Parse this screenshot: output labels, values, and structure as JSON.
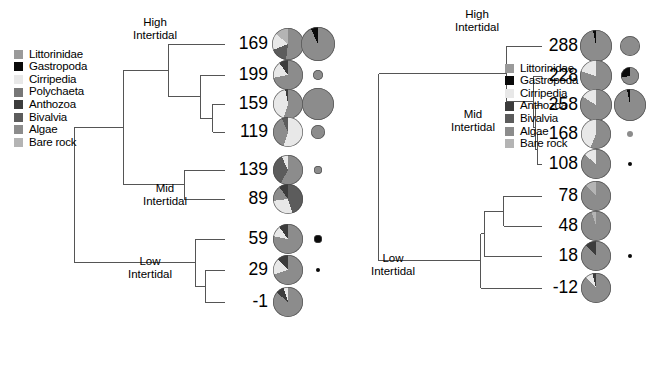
{
  "figure": {
    "width": 659,
    "height": 388,
    "background": "#ffffff"
  },
  "colors": {
    "Littorinidae": "#9a9a9a",
    "Gastropoda": "#0a0a0a",
    "Cirripedia": "#e8e8e8",
    "Polychaeta": "#777777",
    "Anthozoa": "#3c3c3c",
    "Bivalvia": "#5c5c5c",
    "Algae": "#8c8c8c",
    "Bare rock": "#b4b4b4",
    "line": "#555555",
    "text": "#000000"
  },
  "panels": [
    {
      "id": "left",
      "legend": {
        "title": "",
        "items": [
          {
            "label": "Littorinidae",
            "color": "#9a9a9a"
          },
          {
            "label": "Gastropoda",
            "color": "#0a0a0a"
          },
          {
            "label": "Cirripedia",
            "color": "#e8e8e8"
          },
          {
            "label": "Polychaeta",
            "color": "#777777"
          },
          {
            "label": "Anthozoa",
            "color": "#3c3c3c"
          },
          {
            "label": "Bivalvia",
            "color": "#5c5c5c"
          },
          {
            "label": "Algae",
            "color": "#8c8c8c"
          },
          {
            "label": "Bare rock",
            "color": "#b4b4b4"
          }
        ]
      },
      "cluster_names": [
        {
          "label": "High\nIntertidal",
          "line1": "High",
          "line2": "Intertidal"
        },
        {
          "label": "Mid\nIntertidal",
          "line1": "Mid",
          "line2": "Intertidal"
        },
        {
          "label": "Low\nIntertidal",
          "line1": "Low",
          "line2": "Intertidal"
        }
      ],
      "tips": [
        "169",
        "199",
        "159",
        "119",
        "139",
        "89",
        "59",
        "29",
        "-1"
      ],
      "axis": {
        "title": "Chord distance",
        "ticks": [
          "1.50",
          "1.25",
          "1.00",
          "0.75",
          "0.50",
          "0.25",
          "0.00"
        ],
        "min": 0.0,
        "max": 1.5,
        "reversed": true
      }
    },
    {
      "id": "right",
      "legend": {
        "title": "",
        "items": [
          {
            "label": "Littorinidae",
            "color": "#9a9a9a"
          },
          {
            "label": "Gastropoda",
            "color": "#0a0a0a"
          },
          {
            "label": "Cirripedia",
            "color": "#e8e8e8"
          },
          {
            "label": "Anthozoa",
            "color": "#3c3c3c"
          },
          {
            "label": "Bivalvia",
            "color": "#5c5c5c"
          },
          {
            "label": "Algae",
            "color": "#8c8c8c"
          },
          {
            "label": "Bare rock",
            "color": "#b4b4b4"
          }
        ]
      },
      "cluster_names": [
        {
          "label": "High\nIntertidal",
          "line1": "High",
          "line2": "Intertidal"
        },
        {
          "label": "Mid\nIntertidal",
          "line1": "Mid",
          "line2": "Intertidal"
        },
        {
          "label": "Low\nIntertidal",
          "line1": "Low",
          "line2": "Intertidal"
        }
      ],
      "tips": [
        "288",
        "228",
        "258",
        "168",
        "108",
        "78",
        "48",
        "18",
        "-12"
      ],
      "axis": {
        "title": "Chord distance",
        "ticks": [
          "1.50",
          "1.25",
          "1.00",
          "0.75",
          "0.50",
          "0.25",
          "0.00"
        ],
        "min": 0.0,
        "max": 1.5,
        "reversed": true
      }
    }
  ],
  "chart_data": {
    "type": "dendrogram-with-pies",
    "title": "",
    "xlabel": "Chord distance",
    "xlim": [
      1.5,
      0.0
    ],
    "x_ticks": [
      1.5,
      1.25,
      1.0,
      0.75,
      0.5,
      0.25,
      0.0
    ],
    "grid": false,
    "legend_position": "upper-left",
    "categories": [
      "Littorinidae",
      "Gastropoda",
      "Cirripedia",
      "Polychaeta",
      "Anthozoa",
      "Bivalvia",
      "Algae",
      "Bare rock"
    ],
    "panels": [
      {
        "name": "left",
        "leaves": [
          "169",
          "199",
          "159",
          "119",
          "139",
          "89",
          "59",
          "29",
          "-1"
        ],
        "clusters": [
          {
            "name": "High Intertidal",
            "members": [
              "169",
              "199",
              "159",
              "119"
            ]
          },
          {
            "name": "Mid Intertidal",
            "members": [
              "139",
              "89"
            ]
          },
          {
            "name": "Low Intertidal",
            "members": [
              "59",
              "29",
              "-1"
            ]
          }
        ],
        "merges": [
          {
            "left": "159",
            "right": "119",
            "height": 0.1
          },
          {
            "left": "199",
            "right": "(159,119)",
            "height": 0.2
          },
          {
            "left": "169",
            "right": "(199,159,119)",
            "height": 0.46
          },
          {
            "left": "139",
            "right": "89",
            "height": 0.33
          },
          {
            "left": "High",
            "right": "Mid",
            "height": 0.82
          },
          {
            "left": "59",
            "right": "(29,-1)",
            "height": 0.24
          },
          {
            "left": "29",
            "right": "-1",
            "height": 0.16
          },
          {
            "left": "(High,Mid)",
            "right": "Low",
            "height": 1.22
          }
        ],
        "series": [
          {
            "leaf": "169",
            "pie": [
              {
                "cat": "Algae",
                "value": 52
              },
              {
                "cat": "Bivalvia",
                "value": 17
              },
              {
                "cat": "Cirripedia",
                "value": 17
              },
              {
                "cat": "Bare rock",
                "value": 14
              }
            ],
            "pie_radius_px": 16,
            "satellite_radius_px": 17,
            "satellite_color": "#9a9a9a",
            "satellite_pie": [
              {
                "cat": "Algae",
                "value": 93
              },
              {
                "cat": "Gastropoda",
                "value": 7
              }
            ]
          },
          {
            "leaf": "199",
            "pie": [
              {
                "cat": "Algae",
                "value": 72
              },
              {
                "cat": "Cirripedia",
                "value": 18
              },
              {
                "cat": "Anthozoa",
                "value": 10
              }
            ],
            "pie_radius_px": 15,
            "satellite_radius_px": 5,
            "satellite_color": "#9a9a9a",
            "satellite_pie": [
              {
                "cat": "Algae",
                "value": 100
              }
            ]
          },
          {
            "leaf": "159",
            "pie": [
              {
                "cat": "Algae",
                "value": 55
              },
              {
                "cat": "Cirripedia",
                "value": 42
              },
              {
                "cat": "Anthozoa",
                "value": 3
              }
            ],
            "pie_radius_px": 15,
            "satellite_radius_px": 16,
            "satellite_color": "#9a9a9a",
            "satellite_pie": [
              {
                "cat": "Algae",
                "value": 100
              }
            ]
          },
          {
            "leaf": "119",
            "pie": [
              {
                "cat": "Cirripedia",
                "value": 55
              },
              {
                "cat": "Algae",
                "value": 38
              },
              {
                "cat": "Bivalvia",
                "value": 7
              }
            ],
            "pie_radius_px": 15,
            "satellite_radius_px": 7,
            "satellite_color": "#9a9a9a",
            "satellite_pie": [
              {
                "cat": "Algae",
                "value": 100
              }
            ]
          },
          {
            "leaf": "139",
            "pie": [
              {
                "cat": "Algae",
                "value": 58
              },
              {
                "cat": "Bivalvia",
                "value": 35
              },
              {
                "cat": "Cirripedia",
                "value": 7
              }
            ],
            "pie_radius_px": 15,
            "satellite_radius_px": 4,
            "satellite_color": "#9a9a9a",
            "satellite_pie": [
              {
                "cat": "Algae",
                "value": 100
              }
            ]
          },
          {
            "leaf": "89",
            "pie": [
              {
                "cat": "Bivalvia",
                "value": 45
              },
              {
                "cat": "Cirripedia",
                "value": 28
              },
              {
                "cat": "Algae",
                "value": 17
              },
              {
                "cat": "Anthozoa",
                "value": 10
              }
            ],
            "pie_radius_px": 15,
            "satellite_radius_px": 0,
            "satellite_color": "#9a9a9a",
            "satellite_pie": []
          },
          {
            "leaf": "59",
            "pie": [
              {
                "cat": "Algae",
                "value": 78
              },
              {
                "cat": "Cirripedia",
                "value": 12
              },
              {
                "cat": "Anthozoa",
                "value": 10
              }
            ],
            "pie_radius_px": 15,
            "satellite_radius_px": 4,
            "satellite_color": "#0a0a0a",
            "satellite_pie": [
              {
                "cat": "Gastropoda",
                "value": 100
              }
            ]
          },
          {
            "leaf": "29",
            "pie": [
              {
                "cat": "Algae",
                "value": 70
              },
              {
                "cat": "Cirripedia",
                "value": 18
              },
              {
                "cat": "Anthozoa",
                "value": 12
              }
            ],
            "pie_radius_px": 15,
            "satellite_radius_px": 2,
            "satellite_color": "#0a0a0a",
            "satellite_pie": [
              {
                "cat": "Gastropoda",
                "value": 100
              }
            ]
          },
          {
            "leaf": "-1",
            "pie": [
              {
                "cat": "Algae",
                "value": 86
              },
              {
                "cat": "Anthozoa",
                "value": 9
              },
              {
                "cat": "Cirripedia",
                "value": 5
              }
            ],
            "pie_radius_px": 15,
            "satellite_radius_px": 0,
            "satellite_color": "#0a0a0a",
            "satellite_pie": []
          }
        ]
      },
      {
        "name": "right",
        "leaves": [
          "288",
          "228",
          "258",
          "168",
          "108",
          "78",
          "48",
          "18",
          "-12"
        ],
        "clusters": [
          {
            "name": "High Intertidal",
            "members": [
              "288",
              "228",
              "258",
              "168",
              "108"
            ]
          },
          {
            "name": "Mid Intertidal",
            "members": [
              "228",
              "258",
              "168",
              "108"
            ]
          },
          {
            "name": "Low Intertidal",
            "members": [
              "78",
              "48",
              "18",
              "-12"
            ]
          }
        ],
        "merges": [
          {
            "left": "288",
            "right": "Mid",
            "height": 0.29
          },
          {
            "left": "228",
            "right": "(258,168,108)",
            "height": 0.06
          },
          {
            "left": "258",
            "right": "(168,108)",
            "height": 0.05
          },
          {
            "left": "168",
            "right": "108",
            "height": 0.04
          },
          {
            "left": "78",
            "right": "48",
            "height": 0.31
          },
          {
            "left": "(78,48)",
            "right": "18",
            "height": 0.47
          },
          {
            "left": "((78,48),18)",
            "right": "-12",
            "height": 0.5
          },
          {
            "left": "High",
            "right": "Low",
            "height": 1.33
          }
        ],
        "series": [
          {
            "leaf": "288",
            "pie": [
              {
                "cat": "Algae",
                "value": 97
              },
              {
                "cat": "Gastropoda",
                "value": 3
              }
            ],
            "pie_radius_px": 16,
            "satellite_radius_px": 10,
            "satellite_color": "#9a9a9a",
            "satellite_pie": [
              {
                "cat": "Algae",
                "value": 100
              }
            ]
          },
          {
            "leaf": "228",
            "pie": [
              {
                "cat": "Algae",
                "value": 80
              },
              {
                "cat": "Cirripedia",
                "value": 20
              }
            ],
            "pie_radius_px": 16,
            "satellite_radius_px": 9,
            "satellite_color": "#9a9a9a",
            "satellite_pie": [
              {
                "cat": "Algae",
                "value": 72
              },
              {
                "cat": "Gastropoda",
                "value": 28
              }
            ]
          },
          {
            "leaf": "258",
            "pie": [
              {
                "cat": "Algae",
                "value": 84
              },
              {
                "cat": "Cirripedia",
                "value": 16
              }
            ],
            "pie_radius_px": 16,
            "satellite_radius_px": 16,
            "satellite_color": "#9a9a9a",
            "satellite_pie": [
              {
                "cat": "Algae",
                "value": 97
              },
              {
                "cat": "Gastropoda",
                "value": 3
              }
            ]
          },
          {
            "leaf": "168",
            "pie": [
              {
                "cat": "Algae",
                "value": 56
              },
              {
                "cat": "Cirripedia",
                "value": 44
              }
            ],
            "pie_radius_px": 15,
            "satellite_radius_px": 3,
            "satellite_color": "#9a9a9a",
            "satellite_pie": [
              {
                "cat": "Algae",
                "value": 100
              }
            ]
          },
          {
            "leaf": "108",
            "pie": [
              {
                "cat": "Algae",
                "value": 86
              },
              {
                "cat": "Cirripedia",
                "value": 14
              }
            ],
            "pie_radius_px": 15,
            "satellite_radius_px": 2,
            "satellite_color": "#0a0a0a",
            "satellite_pie": [
              {
                "cat": "Gastropoda",
                "value": 100
              }
            ]
          },
          {
            "leaf": "78",
            "pie": [
              {
                "cat": "Algae",
                "value": 88
              },
              {
                "cat": "Bare rock",
                "value": 12
              }
            ],
            "pie_radius_px": 15,
            "satellite_radius_px": 0,
            "satellite_color": "#9a9a9a",
            "satellite_pie": []
          },
          {
            "leaf": "48",
            "pie": [
              {
                "cat": "Algae",
                "value": 95
              },
              {
                "cat": "Bare rock",
                "value": 5
              }
            ],
            "pie_radius_px": 15,
            "satellite_radius_px": 0,
            "satellite_color": "#9a9a9a",
            "satellite_pie": []
          },
          {
            "leaf": "18",
            "pie": [
              {
                "cat": "Algae",
                "value": 88
              },
              {
                "cat": "Anthozoa",
                "value": 12
              }
            ],
            "pie_radius_px": 15,
            "satellite_radius_px": 2,
            "satellite_color": "#0a0a0a",
            "satellite_pie": [
              {
                "cat": "Gastropoda",
                "value": 100
              }
            ]
          },
          {
            "leaf": "-12",
            "pie": [
              {
                "cat": "Algae",
                "value": 88
              },
              {
                "cat": "Cirripedia",
                "value": 8
              },
              {
                "cat": "Anthozoa",
                "value": 4
              }
            ],
            "pie_radius_px": 15,
            "satellite_radius_px": 0,
            "satellite_color": "#9a9a9a",
            "satellite_pie": []
          }
        ]
      }
    ]
  },
  "layout": {
    "left": {
      "legend_x": 14,
      "legend_y": 48,
      "axis_x0": 40,
      "axis_x1": 225,
      "axis_y": 322,
      "axis_title_x": 132,
      "axis_title_y": 348,
      "pie_cx": 288,
      "sat_cx": 318,
      "rows_y": [
        44,
        75,
        104,
        132,
        170,
        199,
        239,
        270,
        302
      ],
      "label_right": 268,
      "cluster_pos": [
        {
          "x": 155,
          "y": 16
        },
        {
          "x": 165,
          "y": 182
        },
        {
          "x": 150,
          "y": 255
        }
      ]
    },
    "right": {
      "legend_x": 175,
      "legend_y": 62,
      "axis_x0": 28,
      "axis_x1": 212,
      "axis_y": 322,
      "axis_title_x": 120,
      "axis_title_y": 348,
      "pie_cx": 266,
      "sat_cx": 300,
      "rows_y": [
        46,
        76,
        105,
        134,
        164,
        196,
        226,
        256,
        288
      ],
      "label_right": 248,
      "cluster_pos": [
        {
          "x": 147,
          "y": 8
        },
        {
          "x": 143,
          "y": 108
        },
        {
          "x": 63,
          "y": 252
        }
      ]
    }
  }
}
